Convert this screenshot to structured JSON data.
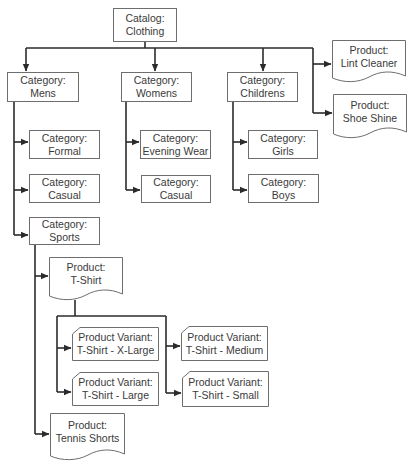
{
  "diagram": {
    "type": "hierarchy",
    "stroke_color": "#2b2b2b",
    "box_border_color": "#6e6e6e",
    "root": {
      "id": "catalog",
      "kind": "Catalog",
      "label": "Clothing",
      "title": "Catalog:"
    },
    "nodes": {
      "catalog": {
        "title": "Catalog:",
        "name": "Clothing",
        "shape": "rect"
      },
      "mens": {
        "title": "Category:",
        "name": "Mens",
        "shape": "rect"
      },
      "womens": {
        "title": "Category:",
        "name": "Womens",
        "shape": "rect"
      },
      "childrens": {
        "title": "Category:",
        "name": "Childrens",
        "shape": "rect"
      },
      "lint_cleaner": {
        "title": "Product:",
        "name": "Lint Cleaner",
        "shape": "document"
      },
      "shoe_shine": {
        "title": "Product:",
        "name": "Shoe Shine",
        "shape": "document"
      },
      "mens_formal": {
        "title": "Category:",
        "name": "Formal",
        "shape": "rect"
      },
      "mens_casual": {
        "title": "Category:",
        "name": "Casual",
        "shape": "rect"
      },
      "mens_sports": {
        "title": "Category:",
        "name": "Sports",
        "shape": "rect"
      },
      "womens_evening": {
        "title": "Category:",
        "name": "Evening Wear",
        "shape": "rect"
      },
      "womens_casual": {
        "title": "Category:",
        "name": "Casual",
        "shape": "rect"
      },
      "child_girls": {
        "title": "Category:",
        "name": "Girls",
        "shape": "rect"
      },
      "child_boys": {
        "title": "Category:",
        "name": "Boys",
        "shape": "rect"
      },
      "tshirt": {
        "title": "Product:",
        "name": "T-Shirt",
        "shape": "document"
      },
      "tennis_shorts": {
        "title": "Product:",
        "name": "Tennis Shorts",
        "shape": "document"
      },
      "var_xl": {
        "title": "Product Variant:",
        "name": "T-Shirt - X-Large",
        "shape": "cut-corner"
      },
      "var_l": {
        "title": "Product Variant:",
        "name": "T-Shirt - Large",
        "shape": "cut-corner"
      },
      "var_m": {
        "title": "Product Variant:",
        "name": "T-Shirt - Medium",
        "shape": "cut-corner"
      },
      "var_s": {
        "title": "Product Variant:",
        "name": "T-Shirt - Small",
        "shape": "cut-corner"
      }
    },
    "edges": [
      [
        "catalog",
        "mens"
      ],
      [
        "catalog",
        "womens"
      ],
      [
        "catalog",
        "childrens"
      ],
      [
        "catalog",
        "lint_cleaner"
      ],
      [
        "catalog",
        "shoe_shine"
      ],
      [
        "mens",
        "mens_formal"
      ],
      [
        "mens",
        "mens_casual"
      ],
      [
        "mens",
        "mens_sports"
      ],
      [
        "womens",
        "womens_evening"
      ],
      [
        "womens",
        "womens_casual"
      ],
      [
        "childrens",
        "child_girls"
      ],
      [
        "childrens",
        "child_boys"
      ],
      [
        "mens_sports",
        "tshirt"
      ],
      [
        "mens_sports",
        "tennis_shorts"
      ],
      [
        "tshirt",
        "var_xl"
      ],
      [
        "tshirt",
        "var_l"
      ],
      [
        "tshirt",
        "var_m"
      ],
      [
        "tshirt",
        "var_s"
      ]
    ]
  }
}
